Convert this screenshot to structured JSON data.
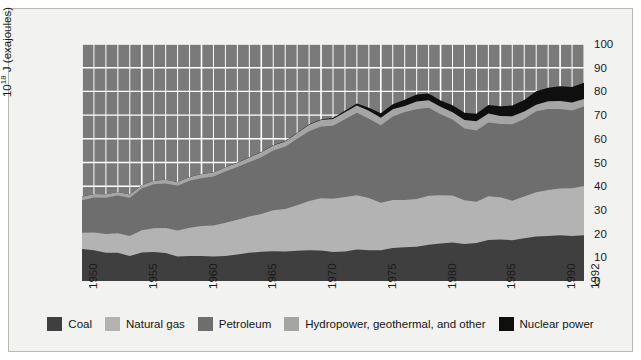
{
  "chart_data": {
    "type": "area",
    "stacked": true,
    "title": "",
    "xlabel": "",
    "ylabel": "10^18 J (exajoules)",
    "ylabel_html": "10<sup>18</sup> J (exajoules)",
    "ylim": [
      0,
      100
    ],
    "xlim": [
      1950,
      1992
    ],
    "grid": true,
    "grid_color": "#ffffff",
    "plot_background": "#7a7a7a",
    "y_ticks": [
      0,
      10,
      20,
      30,
      40,
      50,
      60,
      70,
      80,
      90,
      100
    ],
    "y_ticks_right": [
      0,
      10,
      20,
      30,
      40,
      50,
      60,
      70,
      80,
      90,
      100
    ],
    "x_ticks": [
      1950,
      1955,
      1960,
      1965,
      1970,
      1975,
      1980,
      1985,
      1990,
      1992
    ],
    "x_minor_gridline_interval": 1,
    "legend_position": "bottom",
    "x": [
      1950,
      1951,
      1952,
      1953,
      1954,
      1955,
      1956,
      1957,
      1958,
      1959,
      1960,
      1961,
      1962,
      1963,
      1964,
      1965,
      1966,
      1967,
      1968,
      1969,
      1970,
      1971,
      1972,
      1973,
      1974,
      1975,
      1976,
      1977,
      1978,
      1979,
      1980,
      1981,
      1982,
      1983,
      1984,
      1985,
      1986,
      1987,
      1988,
      1989,
      1990,
      1991,
      1992
    ],
    "series": [
      {
        "name": "Coal",
        "color": "#3f3f3f",
        "values": [
          13.5,
          13.0,
          11.9,
          11.9,
          10.5,
          12.0,
          12.2,
          11.8,
          10.3,
          10.5,
          10.5,
          10.3,
          10.6,
          11.2,
          11.9,
          12.3,
          12.6,
          12.4,
          12.8,
          13.0,
          12.9,
          12.2,
          12.5,
          13.3,
          13.0,
          13.0,
          13.9,
          14.2,
          14.4,
          15.3,
          15.8,
          16.2,
          15.6,
          16.0,
          17.3,
          17.5,
          17.2,
          18.0,
          18.8,
          19.0,
          19.3,
          19.0,
          19.3
        ]
      },
      {
        "name": "Natural gas",
        "color": "#b3b3b3",
        "values": [
          6.9,
          7.5,
          7.9,
          8.2,
          8.5,
          9.4,
          10.1,
          10.6,
          11.0,
          12.0,
          12.7,
          13.1,
          14.0,
          14.6,
          15.3,
          16.0,
          17.2,
          18.0,
          19.2,
          20.8,
          22.0,
          22.5,
          22.9,
          22.9,
          22.0,
          20.0,
          20.3,
          20.0,
          20.2,
          20.7,
          20.4,
          19.9,
          18.5,
          17.4,
          18.5,
          17.8,
          16.7,
          17.7,
          18.6,
          19.4,
          19.7,
          20.1,
          20.8
        ]
      },
      {
        "name": "Petroleum",
        "color": "#6e6e6e",
        "values": [
          13.7,
          14.7,
          15.3,
          16.0,
          16.1,
          17.6,
          18.5,
          18.7,
          18.9,
          19.8,
          20.2,
          20.7,
          21.6,
          22.3,
          23.0,
          23.9,
          25.3,
          26.2,
          28.0,
          29.4,
          30.3,
          30.8,
          32.9,
          34.8,
          33.5,
          32.7,
          35.2,
          37.1,
          37.9,
          37.1,
          34.2,
          32.0,
          30.2,
          30.1,
          31.1,
          30.9,
          32.2,
          32.7,
          34.2,
          34.2,
          33.6,
          32.8,
          33.5
        ]
      },
      {
        "name": "Hydropower, geothermal, and other",
        "color": "#a5a5a5",
        "values": [
          1.4,
          1.5,
          1.5,
          1.5,
          1.4,
          1.4,
          1.5,
          1.6,
          1.6,
          1.6,
          1.7,
          1.7,
          1.8,
          1.8,
          1.9,
          2.1,
          2.1,
          2.3,
          2.3,
          2.7,
          2.7,
          2.9,
          2.9,
          3.0,
          3.3,
          3.2,
          3.1,
          2.5,
          3.2,
          3.2,
          3.1,
          3.1,
          3.6,
          3.9,
          3.8,
          3.4,
          3.4,
          3.1,
          2.8,
          3.2,
          3.4,
          3.4,
          3.2
        ]
      },
      {
        "name": "Nuclear power",
        "color": "#0f0f0f",
        "values": [
          0.0,
          0.0,
          0.0,
          0.0,
          0.0,
          0.0,
          0.0,
          0.0,
          0.0,
          0.0,
          0.0,
          0.0,
          0.0,
          0.1,
          0.1,
          0.1,
          0.1,
          0.2,
          0.2,
          0.2,
          0.2,
          0.4,
          0.6,
          0.9,
          1.3,
          1.9,
          2.1,
          2.7,
          3.0,
          2.8,
          2.7,
          3.0,
          3.1,
          3.2,
          3.6,
          4.1,
          4.5,
          4.9,
          5.7,
          5.7,
          6.2,
          6.6,
          6.8
        ]
      }
    ]
  },
  "axis": {
    "y_label": "10^18 J (exajoules)",
    "y_label_prefix": "10",
    "y_label_exponent": "18",
    "y_label_suffix": " J (exajoules)"
  },
  "legend": {
    "items": [
      {
        "label": "Coal",
        "color": "#3f3f3f"
      },
      {
        "label": "Natural gas",
        "color": "#b3b3b3"
      },
      {
        "label": "Petroleum",
        "color": "#6e6e6e"
      },
      {
        "label": "Hydropower, geothermal, and other",
        "color": "#a5a5a5"
      },
      {
        "label": "Nuclear power",
        "color": "#0f0f0f"
      }
    ]
  },
  "colors": {
    "figure_background": "#f2f2f0",
    "plot_background": "#7a7a7a",
    "grid": "#ffffff",
    "text": "#1a1a1a",
    "border": "#b8b8b4"
  }
}
